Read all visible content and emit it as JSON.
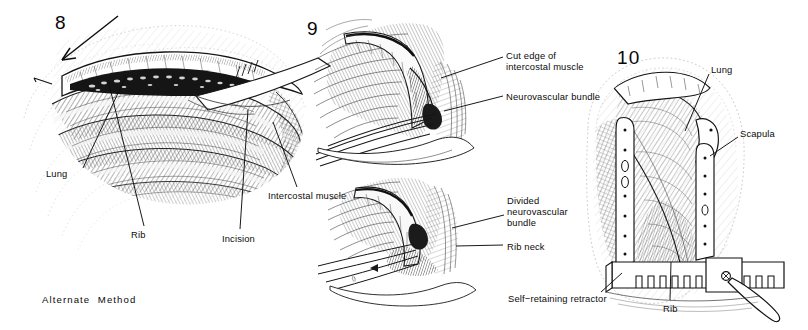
{
  "plate": {
    "title": "Thoracotomy — alternate method, intercostal approach",
    "background_color": "#ffffff",
    "ink_color": "#111111",
    "style": "pen-and-ink line engraving with cross-hatching, grayscale"
  },
  "panels": [
    {
      "id": "panel-8",
      "number": "8",
      "number_pos": {
        "x": 55,
        "y": 12
      },
      "caption": "Alternate  Method",
      "caption_pos": {
        "x": 42,
        "y": 294
      },
      "subject": "Chest wall opened through intercostal incision, lung visible beneath",
      "labels": [
        {
          "name": "lung",
          "text": "Lung",
          "x": 46,
          "y": 168,
          "anchor_x": 83,
          "anchor_y": 168,
          "tip_x": 126,
          "tip_y": 76
        },
        {
          "name": "rib",
          "text": "Rib",
          "x": 131,
          "y": 229,
          "anchor_x": 144,
          "anchor_y": 226,
          "tip_x": 108,
          "tip_y": 80
        },
        {
          "name": "incision",
          "text": "Incision",
          "x": 222,
          "y": 233,
          "anchor_x": 240,
          "anchor_y": 229,
          "tip_x": 248,
          "tip_y": 110
        },
        {
          "name": "intercostal-muscle",
          "text": "Intercostal muscle",
          "x": 268,
          "y": 190,
          "anchor_x": 297,
          "anchor_y": 187,
          "tip_x": 273,
          "tip_y": 122
        }
      ]
    },
    {
      "id": "panel-9",
      "number": "9",
      "number_pos": {
        "x": 307,
        "y": 18
      },
      "subject": "Close-up of intercostal space: cut muscle edge and neurovascular bundle",
      "labels": [
        {
          "name": "cut-edge-of-intercostal-muscle",
          "text": "Cut edge of\nintercostal muscle",
          "x": 506,
          "y": 50,
          "anchor_x": 503,
          "anchor_y": 57,
          "tip_x": 441,
          "tip_y": 78
        },
        {
          "name": "neurovascular-bundle",
          "text": "Neurovascular bundle",
          "x": 506,
          "y": 91,
          "anchor_x": 503,
          "anchor_y": 96,
          "tip_x": 444,
          "tip_y": 111
        },
        {
          "name": "divided-neurovascular-bundle",
          "text": "Divided\nneurovascular\nbundle",
          "x": 507,
          "y": 195,
          "anchor_x": 504,
          "anchor_y": 215,
          "tip_x": 452,
          "tip_y": 228
        },
        {
          "name": "rib-neck",
          "text": "Rib neck",
          "x": 507,
          "y": 241,
          "anchor_x": 503,
          "anchor_y": 245,
          "tip_x": 456,
          "tip_y": 246
        }
      ]
    },
    {
      "id": "panel-10",
      "number": "10",
      "number_pos": {
        "x": 617,
        "y": 47
      },
      "subject": "Self-retaining retractor spreading the ribs, lung and scapula exposed",
      "labels": [
        {
          "name": "lung",
          "text": "Lung",
          "x": 711,
          "y": 64,
          "anchor_x": 709,
          "anchor_y": 74,
          "tip_x": 685,
          "tip_y": 131
        },
        {
          "name": "scapula",
          "text": "Scapula",
          "x": 740,
          "y": 128,
          "anchor_x": 738,
          "anchor_y": 137,
          "tip_x": 710,
          "tip_y": 156
        },
        {
          "name": "self-retaining-retractor",
          "text": "Self−retaining retractor",
          "x": 508,
          "y": 293,
          "anchor_x": 601,
          "anchor_y": 292,
          "tip_x": 622,
          "tip_y": 273
        },
        {
          "name": "rib",
          "text": "Rib",
          "x": 663,
          "y": 303,
          "anchor_x": 670,
          "anchor_y": 300,
          "tip_x": 671,
          "tip_y": 262
        }
      ]
    }
  ]
}
